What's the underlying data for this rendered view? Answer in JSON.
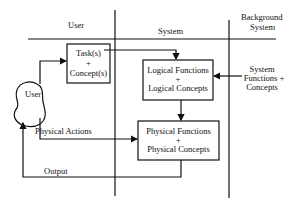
{
  "headers": {
    "user": "User",
    "system": "System",
    "background_line1": "Background",
    "background_line2": "System"
  },
  "boxes": {
    "task": {
      "line1": "Task(s)",
      "line2": "+",
      "line3": "Concept(s)"
    },
    "logical": {
      "line1": "Logical Functions",
      "line2": "+",
      "line3": "Logical Concepts"
    },
    "physical": {
      "line1": "Physical Functions",
      "line2": "+",
      "line3": "Physical Concepts"
    }
  },
  "user_actor": {
    "label": "User"
  },
  "background_node": {
    "line1": "System",
    "line2": "Functions +",
    "line3": "Concepts"
  },
  "edges": {
    "physical_actions": "Physical Actions",
    "output": "Output"
  }
}
